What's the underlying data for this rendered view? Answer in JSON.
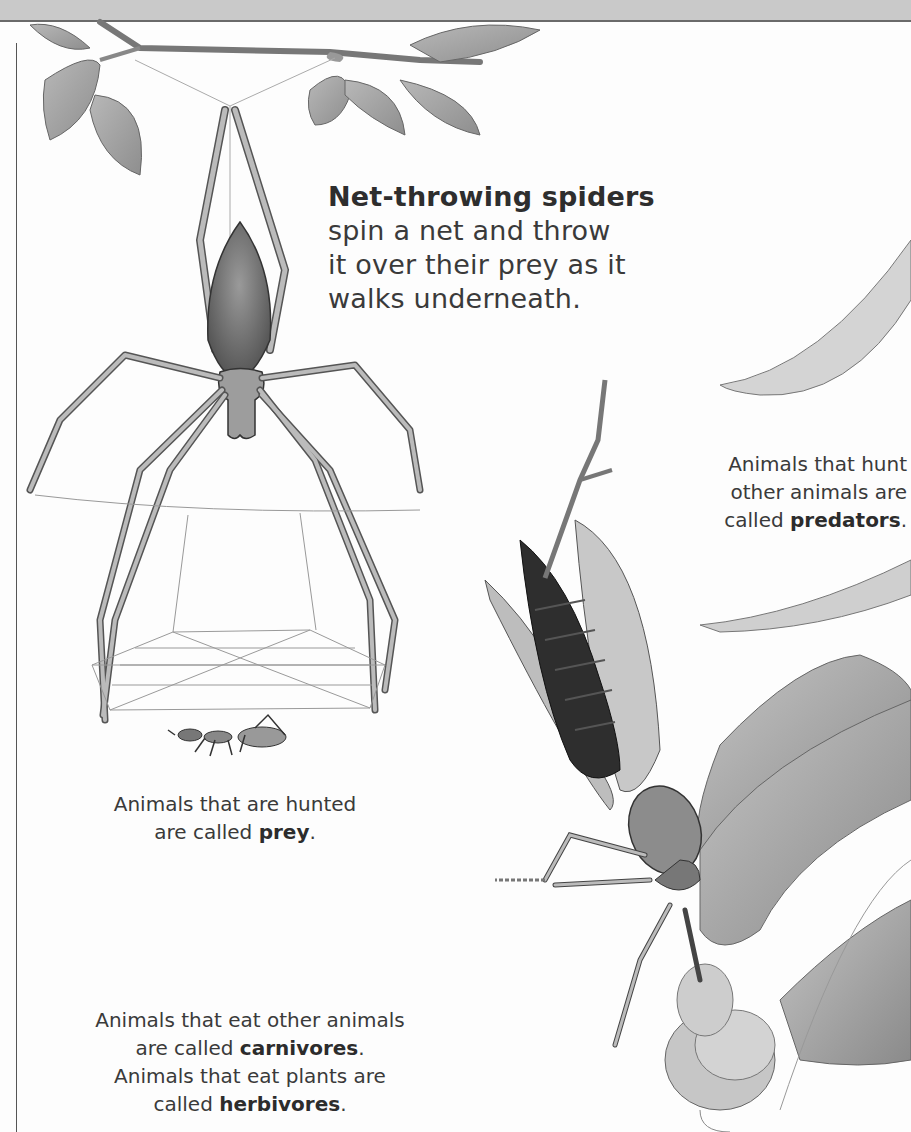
{
  "page": {
    "background": "#fdfdfd",
    "band_color": "#c9c9c9"
  },
  "captions": {
    "net_throwing": {
      "heading": "Net-throwing spiders",
      "lines": [
        "spin a net and throw",
        "it over their prey as it",
        "walks underneath."
      ]
    },
    "predators": {
      "line1": "Animals that hunt",
      "line2": "other animals are",
      "line3_prefix": "called ",
      "term": "predators",
      "suffix": "."
    },
    "prey": {
      "line1": "Animals that are hunted",
      "line2_prefix": "are called ",
      "term": "prey",
      "suffix": "."
    },
    "carnivores": {
      "line1": "Animals that eat other animals",
      "line2_prefix": "are called ",
      "term": "carnivores",
      "suffix": ".",
      "line3": "Animals that eat plants are",
      "line4_prefix": "called ",
      "term2": "herbivores",
      "suffix2": "."
    }
  },
  "illustrations": {
    "branch": "branch-with-leaves",
    "spider": "net-throwing-spider",
    "net": "spider-net",
    "ant": "ant-prey",
    "mantis": "praying-mantis",
    "insect": "captured-insect"
  }
}
